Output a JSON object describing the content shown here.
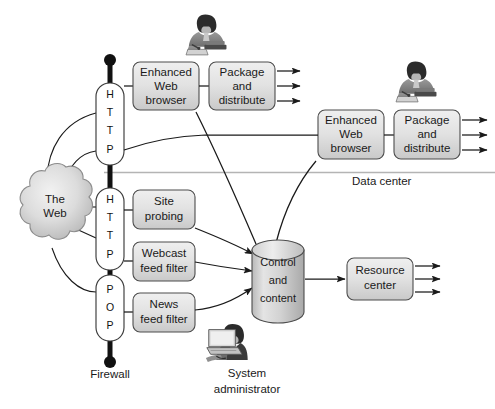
{
  "diagram": {
    "colors": {
      "box_fill_light": "#e6e6e6",
      "box_fill_dark": "#c4c4c4",
      "box_stroke": "#4d4d4d",
      "line": "#1a1a1a",
      "firewall": "#111111",
      "cloud_fill": "#d8d8d8",
      "divider": "#b4b4b4",
      "page_background": "#ffffff"
    },
    "cloud": {
      "name": "the-web-cloud",
      "line1": "The",
      "line2": "Web"
    },
    "firewall": {
      "name": "firewall",
      "label": "Firewall",
      "ports": [
        {
          "id": "port-http-top",
          "letters": [
            "H",
            "T",
            "T",
            "P"
          ],
          "protocol": "HTTP"
        },
        {
          "id": "port-http-mid",
          "letters": [
            "H",
            "T",
            "T",
            "P"
          ],
          "protocol": "HTTP"
        },
        {
          "id": "port-pop",
          "letters": [
            "P",
            "O",
            "P"
          ],
          "protocol": "POP"
        }
      ]
    },
    "zones": [
      {
        "id": "data-center",
        "label": "Data center"
      }
    ],
    "boxes": [
      {
        "id": "enhanced-web-browser-top",
        "lines": [
          "Enhanced",
          "Web",
          "browser"
        ],
        "shade": "light"
      },
      {
        "id": "package-and-distribute-top",
        "lines": [
          "Package",
          "and",
          "distribute"
        ],
        "shade": "light"
      },
      {
        "id": "enhanced-web-browser-dc",
        "lines": [
          "Enhanced",
          "Web",
          "browser"
        ],
        "shade": "light"
      },
      {
        "id": "package-and-distribute-dc",
        "lines": [
          "Package",
          "and",
          "distribute"
        ],
        "shade": "light"
      },
      {
        "id": "site-probing",
        "lines": [
          "Site",
          "probing"
        ],
        "shade": "light"
      },
      {
        "id": "webcast-feed-filter",
        "lines": [
          "Webcast",
          "feed filter"
        ],
        "shade": "light"
      },
      {
        "id": "news-feed-filter",
        "lines": [
          "News",
          "feed filter"
        ],
        "shade": "light"
      },
      {
        "id": "resource-center",
        "lines": [
          "Resource",
          "center"
        ],
        "shade": "light"
      }
    ],
    "cylinder": {
      "id": "control-and-content",
      "lines": [
        "Control",
        "and",
        "content"
      ]
    },
    "actors": [
      {
        "id": "analyst-top",
        "icon": "person-at-desk-icon",
        "label": ""
      },
      {
        "id": "analyst-datacenter",
        "icon": "person-at-desk-icon",
        "label": ""
      },
      {
        "id": "system-administrator",
        "icon": "person-at-computer-icon",
        "label_line1": "System",
        "label_line2": "administrator"
      }
    ],
    "output_arrow_groups": [
      {
        "id": "outputs-package-top",
        "count": 3
      },
      {
        "id": "outputs-package-dc",
        "count": 3
      },
      {
        "id": "outputs-resource-center",
        "count": 3
      }
    ]
  }
}
